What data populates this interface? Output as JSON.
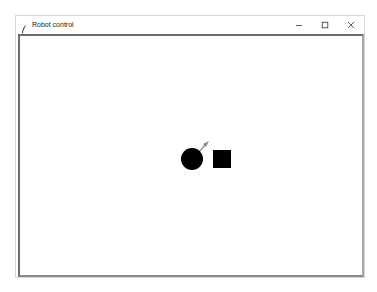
{
  "window": {
    "title": "Robot control",
    "app_icon": "feather-icon",
    "controls": {
      "minimize": "minimize-icon",
      "maximize": "maximize-icon",
      "close": "close-icon"
    }
  },
  "canvas": {
    "background": "#ffffff",
    "robot": {
      "shape": "circle",
      "color": "#000000",
      "heading_arrow_color": "#8c8c8c"
    },
    "target": {
      "shape": "square",
      "color": "#000000"
    }
  }
}
